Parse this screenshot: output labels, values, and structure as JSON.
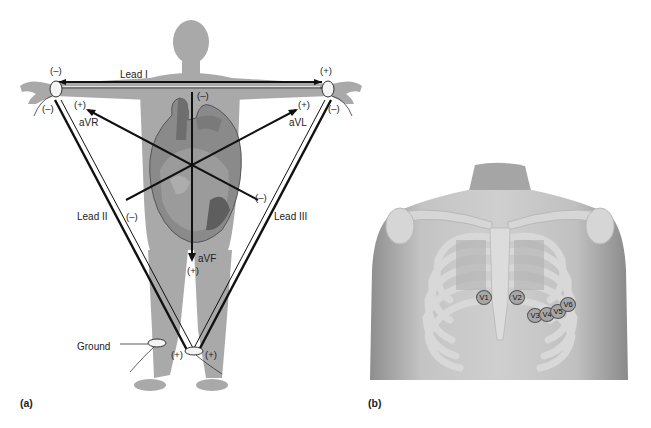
{
  "figure": {
    "panel_a": {
      "letter": "(a)",
      "leads": {
        "lead_i": "Lead I",
        "lead_ii": "Lead II",
        "lead_iii": "Lead III",
        "avr": "aVR",
        "avl": "aVL",
        "avf": "aVF"
      },
      "ground": "Ground",
      "signs": {
        "ra_top": "(–)",
        "la_top": "(+)",
        "ra_bottom": "(–)",
        "la_bottom": "(–)",
        "avr_plus": "(+)",
        "avl_plus": "(+)",
        "avf_minus": "(–)",
        "lead_ii_minus": "(–)",
        "lead_iii_minus": "(–)",
        "avf_plus": "(+)",
        "ll_left_plus": "(+)",
        "ll_right_plus": "(+)"
      }
    },
    "panel_b": {
      "letter": "(b)",
      "chest_leads": [
        "V1",
        "V2",
        "V3",
        "V4",
        "V5",
        "V6"
      ]
    },
    "colors": {
      "body_silhouette": "#a9a9a9",
      "lead_line": "#111111",
      "skin": "#bdbdbd",
      "bone": "#d4d4d4"
    }
  }
}
